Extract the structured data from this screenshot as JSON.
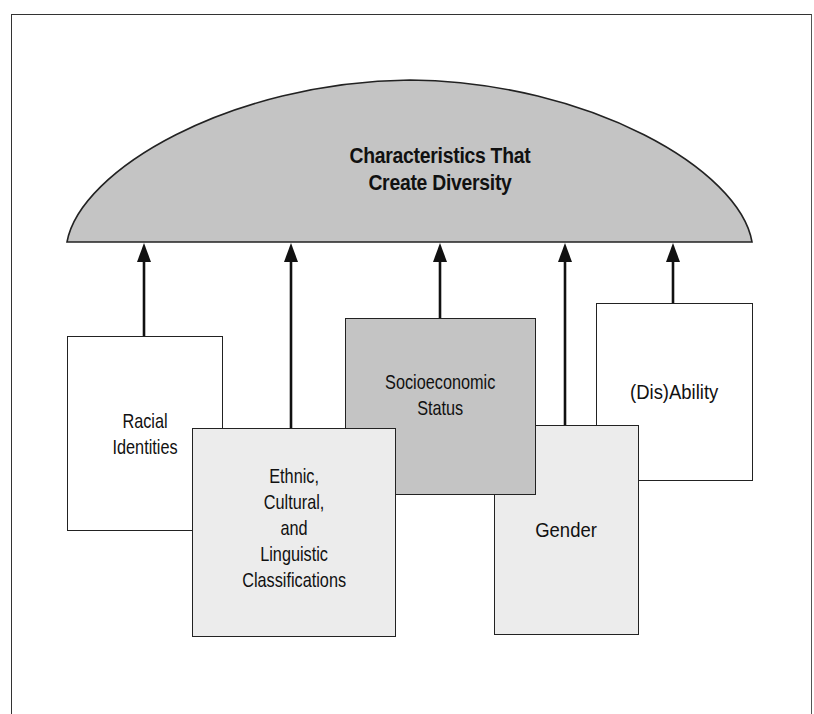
{
  "diagram": {
    "title": "Characteristics That Create Diversity",
    "title_lines": [
      "Characteristics That",
      "Create Diversity"
    ],
    "dome_color": "#c4c4c4",
    "boxes": [
      {
        "id": "racial",
        "lines": [
          "Racial",
          "Identities"
        ],
        "fill": "#ffffff"
      },
      {
        "id": "ethnic",
        "lines": [
          "Ethnic,",
          "Cultural,",
          "and",
          "Linguistic",
          "Classifications"
        ],
        "fill": "#ececec"
      },
      {
        "id": "socioeconomic",
        "lines": [
          "Socioeconomic",
          "Status"
        ],
        "fill": "#c4c4c4"
      },
      {
        "id": "gender",
        "lines": [
          "Gender"
        ],
        "fill": "#ececec"
      },
      {
        "id": "disability",
        "lines": [
          "(Dis)Ability"
        ],
        "fill": "#ffffff"
      }
    ],
    "arrows": [
      {
        "from": "racial",
        "to": "dome"
      },
      {
        "from": "ethnic",
        "to": "dome"
      },
      {
        "from": "socioeconomic",
        "to": "dome"
      },
      {
        "from": "gender",
        "to": "dome"
      },
      {
        "from": "disability",
        "to": "dome"
      }
    ]
  }
}
